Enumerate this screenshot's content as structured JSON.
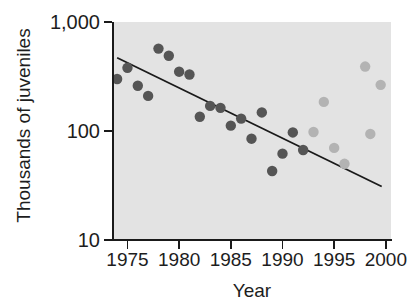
{
  "chart_data": {
    "type": "scatter",
    "title": "",
    "xlabel": "Year",
    "ylabel": "Thousands of juveniles",
    "xlim": [
      1973.6,
      2000.5
    ],
    "ylim": [
      10,
      1000
    ],
    "yscale": "log",
    "grid": false,
    "legend": "none",
    "x_ticks": [
      1975,
      1980,
      1985,
      1990,
      1995,
      2000
    ],
    "x_tick_labels": [
      "1975",
      "1980",
      "1985",
      "1990",
      "1995",
      "2000"
    ],
    "y_ticks": [
      10,
      100,
      1000
    ],
    "y_tick_labels": [
      "10",
      "100",
      "1,000"
    ],
    "plot_background": "#e3e3e3",
    "series": [
      {
        "name": "dark-points",
        "color": "#555555",
        "marker": "circle",
        "points": [
          {
            "x": 1974.0,
            "y": 300
          },
          {
            "x": 1975.0,
            "y": 380
          },
          {
            "x": 1976.0,
            "y": 260
          },
          {
            "x": 1977.0,
            "y": 210
          },
          {
            "x": 1978.0,
            "y": 570
          },
          {
            "x": 1979.0,
            "y": 490
          },
          {
            "x": 1980.0,
            "y": 350
          },
          {
            "x": 1981.0,
            "y": 330
          },
          {
            "x": 1982.0,
            "y": 135
          },
          {
            "x": 1983.0,
            "y": 170
          },
          {
            "x": 1984.0,
            "y": 163
          },
          {
            "x": 1985.0,
            "y": 112
          },
          {
            "x": 1986.0,
            "y": 130
          },
          {
            "x": 1987.0,
            "y": 85
          },
          {
            "x": 1988.0,
            "y": 148
          },
          {
            "x": 1989.0,
            "y": 43
          },
          {
            "x": 1990.0,
            "y": 62
          },
          {
            "x": 1991.0,
            "y": 97
          },
          {
            "x": 1992.0,
            "y": 67
          }
        ]
      },
      {
        "name": "light-points",
        "color": "#b3b3b3",
        "marker": "circle",
        "points": [
          {
            "x": 1993.0,
            "y": 98
          },
          {
            "x": 1994.0,
            "y": 185
          },
          {
            "x": 1995.0,
            "y": 70
          },
          {
            "x": 1996.0,
            "y": 50
          },
          {
            "x": 1998.0,
            "y": 390
          },
          {
            "x": 1998.5,
            "y": 94
          },
          {
            "x": 1999.5,
            "y": 265
          }
        ]
      }
    ],
    "trend_line": {
      "name": "regression-line",
      "color": "#1a1a1a",
      "x_start": 1974.0,
      "y_start": 470,
      "x_end": 1999.6,
      "y_end": 31
    }
  }
}
